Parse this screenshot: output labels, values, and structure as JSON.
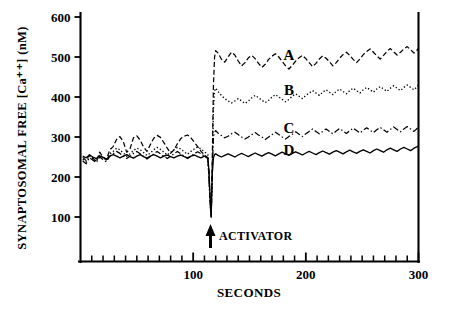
{
  "figure": {
    "name": "synaptosomal-free-calcium-timecourse"
  },
  "axes": {
    "y_title": "SYNAPTOSOMAL  FREE  [Ca⁺⁺]  (nM)",
    "x_title": "SECONDS",
    "y_ticklabels": [
      "100",
      "200",
      "300",
      "400",
      "500",
      "600"
    ],
    "x_ticklabels": [
      "100",
      "200",
      "300"
    ]
  },
  "curve_labels": {
    "a": "A",
    "b": "B",
    "c": "C",
    "d": "D"
  },
  "annotations": {
    "activator": "ACTIVATOR"
  },
  "colors": {
    "ink": "#000000",
    "background": "#ffffff"
  },
  "chart_data": {
    "type": "line",
    "title": "",
    "subtitle": "",
    "xlabel": "SECONDS",
    "ylabel": "SYNAPTOSOMAL FREE [Ca++] (nM)",
    "xlim": [
      0,
      300
    ],
    "ylim": [
      0,
      600
    ],
    "y_ticks": [
      100,
      200,
      300,
      400,
      500,
      600
    ],
    "y_minor_tick_step": 0,
    "x_ticks": [
      100,
      200,
      300
    ],
    "x_minor_tick_step": 10,
    "grid": false,
    "legend": "inline-curve-labels",
    "legend_position": "right-of-traces",
    "annotations": [
      {
        "text": "ACTIVATOR",
        "x": 116,
        "y": 60,
        "arrow": "up",
        "description": "upward arrow at approximately 116 seconds marking activator addition"
      }
    ],
    "event": {
      "name": "activator addition",
      "x": 116,
      "note": "all four traces show a sharp transient downward spike to about 100 nM at the moment of addition, then settle at elevated plateaus"
    },
    "series": [
      {
        "name": "A",
        "label": "A",
        "linestyle": "dashed",
        "color": "#000000",
        "label_x": 185,
        "label_y": 505,
        "baseline_mean": 252,
        "plateau_mean": 500,
        "x": [
          2,
          5,
          8,
          11,
          14,
          17,
          20,
          23,
          26,
          29,
          32,
          35,
          38,
          41,
          44,
          47,
          50,
          53,
          56,
          59,
          62,
          65,
          68,
          71,
          74,
          77,
          80,
          83,
          86,
          89,
          92,
          95,
          98,
          101,
          104,
          107,
          110,
          113,
          114,
          115,
          116,
          117,
          118,
          119,
          120,
          122,
          125,
          128,
          131,
          134,
          137,
          140,
          143,
          146,
          149,
          152,
          155,
          158,
          161,
          164,
          167,
          170,
          173,
          176,
          179,
          182,
          185,
          188,
          191,
          194,
          197,
          200,
          203,
          206,
          209,
          212,
          215,
          218,
          221,
          224,
          227,
          230,
          233,
          236,
          239,
          242,
          245,
          248,
          251,
          254,
          257,
          260,
          263,
          266,
          269,
          272,
          275,
          278,
          281,
          284,
          287,
          290,
          293,
          296,
          299,
          300
        ],
        "y": [
          249,
          241,
          256,
          247,
          238,
          262,
          250,
          243,
          268,
          276,
          294,
          301,
          288,
          262,
          271,
          298,
          303,
          292,
          275,
          264,
          281,
          297,
          304,
          299,
          286,
          272,
          259,
          268,
          283,
          296,
          302,
          305,
          298,
          287,
          276,
          264,
          255,
          248,
          210,
          140,
          100,
          250,
          430,
          500,
          516,
          510,
          495,
          487,
          500,
          512,
          505,
          490,
          478,
          486,
          498,
          504,
          496,
          484,
          474,
          482,
          494,
          502,
          508,
          500,
          489,
          478,
          470,
          479,
          490,
          498,
          504,
          496,
          486,
          476,
          484,
          495,
          503,
          497,
          488,
          478,
          486,
          497,
          506,
          512,
          504,
          494,
          486,
          495,
          506,
          514,
          520,
          512,
          503,
          495,
          504,
          514,
          521,
          513,
          505,
          512,
          520,
          526,
          518,
          510,
          518,
          522
        ]
      },
      {
        "name": "B",
        "label": "B",
        "linestyle": "dotted",
        "color": "#000000",
        "label_x": 185,
        "label_y": 418,
        "baseline_mean": 248,
        "plateau_mean": 410,
        "x": [
          2,
          5,
          8,
          11,
          14,
          17,
          20,
          23,
          26,
          29,
          32,
          35,
          38,
          41,
          44,
          47,
          50,
          53,
          56,
          59,
          62,
          65,
          68,
          71,
          74,
          77,
          80,
          83,
          86,
          89,
          92,
          95,
          98,
          101,
          104,
          107,
          110,
          113,
          114,
          115,
          116,
          117,
          118,
          119,
          120,
          122,
          125,
          128,
          131,
          134,
          137,
          140,
          143,
          146,
          149,
          152,
          155,
          158,
          161,
          164,
          167,
          170,
          173,
          176,
          179,
          182,
          185,
          188,
          191,
          194,
          197,
          200,
          203,
          206,
          209,
          212,
          215,
          218,
          221,
          224,
          227,
          230,
          233,
          236,
          239,
          242,
          245,
          248,
          251,
          254,
          257,
          260,
          263,
          266,
          269,
          272,
          275,
          278,
          281,
          284,
          287,
          290,
          293,
          296,
          299,
          300
        ],
        "y": [
          244,
          238,
          252,
          246,
          240,
          255,
          249,
          242,
          258,
          264,
          272,
          268,
          260,
          252,
          258,
          266,
          272,
          268,
          261,
          254,
          260,
          268,
          274,
          269,
          262,
          255,
          262,
          268,
          274,
          270,
          263,
          257,
          264,
          270,
          275,
          270,
          263,
          256,
          205,
          140,
          100,
          230,
          370,
          415,
          422,
          414,
          404,
          396,
          390,
          385,
          390,
          396,
          390,
          384,
          390,
          398,
          404,
          398,
          392,
          386,
          392,
          400,
          406,
          400,
          394,
          388,
          394,
          402,
          408,
          402,
          396,
          404,
          410,
          416,
          410,
          404,
          412,
          418,
          412,
          406,
          414,
          420,
          414,
          408,
          416,
          422,
          416,
          410,
          418,
          424,
          418,
          412,
          420,
          426,
          420,
          414,
          422,
          428,
          422,
          416,
          424,
          430,
          424,
          418,
          426,
          430
        ]
      },
      {
        "name": "C",
        "label": "C",
        "linestyle": "dashdot",
        "color": "#000000",
        "label_x": 185,
        "label_y": 322,
        "baseline_mean": 246,
        "plateau_mean": 318,
        "x": [
          2,
          5,
          8,
          11,
          14,
          17,
          20,
          23,
          26,
          29,
          32,
          35,
          38,
          41,
          44,
          47,
          50,
          53,
          56,
          59,
          62,
          65,
          68,
          71,
          74,
          77,
          80,
          83,
          86,
          89,
          92,
          95,
          98,
          101,
          104,
          107,
          110,
          113,
          114,
          115,
          116,
          117,
          118,
          119,
          120,
          122,
          125,
          128,
          131,
          134,
          137,
          140,
          143,
          146,
          149,
          152,
          155,
          158,
          161,
          164,
          167,
          170,
          173,
          176,
          179,
          182,
          185,
          188,
          191,
          194,
          197,
          200,
          203,
          206,
          209,
          212,
          215,
          218,
          221,
          224,
          227,
          230,
          233,
          236,
          239,
          242,
          245,
          248,
          251,
          254,
          257,
          260,
          263,
          266,
          269,
          272,
          275,
          278,
          281,
          284,
          287,
          290,
          293,
          296,
          299,
          300
        ],
        "y": [
          240,
          233,
          248,
          242,
          236,
          250,
          244,
          238,
          252,
          258,
          264,
          259,
          252,
          246,
          252,
          259,
          264,
          258,
          251,
          245,
          251,
          258,
          264,
          258,
          252,
          246,
          252,
          258,
          264,
          258,
          252,
          246,
          252,
          258,
          263,
          258,
          252,
          246,
          200,
          135,
          100,
          220,
          300,
          312,
          316,
          310,
          304,
          298,
          302,
          308,
          312,
          306,
          300,
          295,
          300,
          306,
          311,
          305,
          300,
          294,
          300,
          306,
          312,
          306,
          300,
          295,
          301,
          307,
          313,
          307,
          301,
          308,
          314,
          320,
          314,
          308,
          314,
          320,
          314,
          308,
          315,
          321,
          315,
          309,
          316,
          322,
          316,
          310,
          317,
          323,
          317,
          311,
          318,
          324,
          318,
          312,
          319,
          325,
          319,
          313,
          320,
          326,
          320,
          314,
          322,
          328
        ]
      },
      {
        "name": "D",
        "label": "D",
        "linestyle": "solid",
        "color": "#000000",
        "label_x": 185,
        "label_y": 268,
        "baseline_mean": 250,
        "plateau_mean": 268,
        "x": [
          2,
          5,
          8,
          11,
          14,
          17,
          20,
          23,
          26,
          29,
          32,
          35,
          38,
          41,
          44,
          47,
          50,
          53,
          56,
          59,
          62,
          65,
          68,
          71,
          74,
          77,
          80,
          83,
          86,
          89,
          92,
          95,
          98,
          101,
          104,
          107,
          110,
          113,
          114,
          115,
          116,
          117,
          118,
          119,
          120,
          122,
          125,
          128,
          131,
          134,
          137,
          140,
          143,
          146,
          149,
          152,
          155,
          158,
          161,
          164,
          167,
          170,
          173,
          176,
          179,
          182,
          185,
          188,
          191,
          194,
          197,
          200,
          203,
          206,
          209,
          212,
          215,
          218,
          221,
          224,
          227,
          230,
          233,
          236,
          239,
          242,
          245,
          248,
          251,
          254,
          257,
          260,
          263,
          266,
          269,
          272,
          275,
          278,
          281,
          284,
          287,
          290,
          293,
          296,
          299,
          300
        ],
        "y": [
          252,
          248,
          255,
          250,
          246,
          253,
          249,
          245,
          252,
          256,
          252,
          248,
          252,
          256,
          251,
          247,
          252,
          256,
          251,
          247,
          252,
          256,
          252,
          248,
          252,
          255,
          251,
          248,
          252,
          255,
          251,
          248,
          252,
          255,
          251,
          248,
          252,
          248,
          215,
          150,
          105,
          210,
          248,
          256,
          258,
          254,
          250,
          254,
          258,
          254,
          250,
          255,
          259,
          255,
          251,
          256,
          260,
          256,
          252,
          257,
          261,
          257,
          253,
          258,
          262,
          258,
          254,
          259,
          263,
          259,
          255,
          260,
          264,
          260,
          256,
          261,
          265,
          261,
          257,
          262,
          266,
          262,
          258,
          263,
          267,
          263,
          259,
          264,
          268,
          264,
          260,
          266,
          270,
          266,
          262,
          268,
          272,
          268,
          264,
          270,
          274,
          270,
          266,
          272,
          276,
          278
        ]
      }
    ]
  }
}
